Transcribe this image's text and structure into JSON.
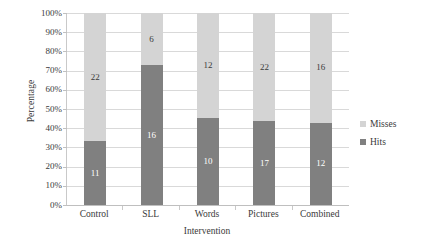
{
  "chart_data": {
    "type": "bar",
    "subtype": "stacked-100-percent",
    "title": "",
    "xlabel": "Intervention",
    "ylabel": "Percentage",
    "categories": [
      "Control",
      "SLL",
      "Words",
      "Pictures",
      "Combined"
    ],
    "series": [
      {
        "name": "Hits",
        "color": "#808080",
        "counts": [
          11,
          16,
          10,
          17,
          12
        ],
        "percentages": [
          33.3,
          72.7,
          45.5,
          43.6,
          42.9
        ]
      },
      {
        "name": "Misses",
        "color": "#d4d4d4",
        "counts": [
          22,
          6,
          12,
          22,
          16
        ],
        "percentages": [
          66.7,
          27.3,
          54.5,
          56.4,
          57.1
        ]
      }
    ],
    "stack_order": [
      "Hits",
      "Misses"
    ],
    "ylim": [
      0,
      100
    ],
    "ytick_labels": [
      "0%",
      "10%",
      "20%",
      "30%",
      "40%",
      "50%",
      "60%",
      "70%",
      "80%",
      "90%",
      "100%"
    ],
    "ytick_values": [
      0,
      10,
      20,
      30,
      40,
      50,
      60,
      70,
      80,
      90,
      100
    ],
    "grid": true,
    "grid_axis": "y",
    "legend_position": "right",
    "data_labels": true
  },
  "legend": {
    "items": [
      {
        "label": "Misses",
        "color": "#d4d4d4"
      },
      {
        "label": "Hits",
        "color": "#808080"
      }
    ]
  },
  "colors": {
    "hits": "#808080",
    "misses": "#d4d4d4",
    "gridline": "#d9d9d9",
    "axis": "#c9c9c9",
    "text": "#3a3a3a",
    "background": "#ffffff"
  }
}
